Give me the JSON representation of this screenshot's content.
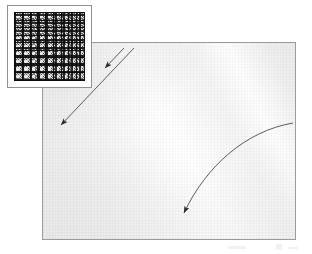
{
  "figure": {
    "canvas": {
      "width": 312,
      "height": 254,
      "background": "#ffffff"
    }
  },
  "main_panel": {
    "name": "flow-field-panel",
    "x": 42,
    "y": 42,
    "width": 254,
    "height": 198,
    "border_color": "#9a9a9a",
    "fill_color": "#f0f0f0",
    "description": "Light grey field with a broad diagonal bright band running from lower-left to upper-right",
    "band_angle_deg": 58
  },
  "inset": {
    "name": "grid-inset-thumbnail",
    "x": 7,
    "y": 5,
    "width": 85,
    "height": 83,
    "border_color": "#8f8f8f",
    "background": "#ffffff",
    "grid": {
      "rows": 9,
      "columns": 9,
      "line_color": "#111111",
      "cell_color": "#dcdcdc",
      "description": "Dense dark mesh grid of noisy square cells"
    }
  },
  "annotations": {
    "arrows": [
      {
        "name": "arrow-upper-straight",
        "type": "straight",
        "label": "",
        "color": "#2b2b2b",
        "from": {
          "x": 123,
          "y": 47
        },
        "to": {
          "x": 104,
          "y": 67
        },
        "direction": "down-left"
      },
      {
        "name": "arrow-lower-straight",
        "type": "straight",
        "label": "",
        "color": "#2b2b2b",
        "from": {
          "x": 133,
          "y": 47
        },
        "to": {
          "x": 60,
          "y": 124
        },
        "direction": "down-left"
      },
      {
        "name": "arrow-curved-right",
        "type": "curved",
        "label": "",
        "color": "#2b2b2b",
        "from": {
          "x": 292,
          "y": 122
        },
        "control1": {
          "x": 245,
          "y": 130
        },
        "control2": {
          "x": 205,
          "y": 165
        },
        "to": {
          "x": 183,
          "y": 212
        },
        "direction": "down-left"
      }
    ],
    "smudges": [
      {
        "name": "scan-smudge-left",
        "x": 228,
        "y": 246
      },
      {
        "name": "scan-smudge-right",
        "x": 276,
        "y": 244
      },
      {
        "name": "scan-smudge-tail",
        "x": 288,
        "y": 247
      }
    ]
  },
  "colors": {
    "panel_border": "#9a9a9a",
    "panel_fill": "#f0f0f0",
    "band_highlight": "#ffffff",
    "arrow": "#2b2b2b",
    "grid_line": "#111111",
    "page_background": "#ffffff"
  }
}
